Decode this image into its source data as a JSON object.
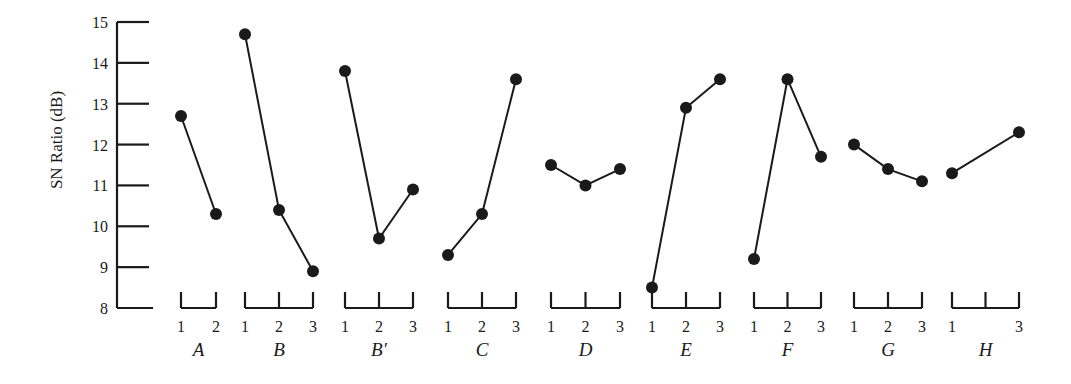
{
  "chart_data": {
    "type": "line",
    "title": "",
    "xlabel": "",
    "ylabel": "SN Ratio (dB)",
    "ylim": [
      8,
      15
    ],
    "yticks": [
      8,
      9,
      10,
      11,
      12,
      13,
      14,
      15
    ],
    "grid": false,
    "legend": null,
    "factors": [
      {
        "name": "A",
        "levels": [
          "1",
          "2"
        ],
        "level_labels": [
          "1",
          "2"
        ],
        "values": [
          12.7,
          10.3
        ]
      },
      {
        "name": "B",
        "levels": [
          "1",
          "2",
          "3"
        ],
        "level_labels": [
          "1",
          "2",
          "3"
        ],
        "values": [
          14.7,
          10.4,
          8.9
        ]
      },
      {
        "name": "B′",
        "levels": [
          "1",
          "2",
          "3"
        ],
        "level_labels": [
          "1",
          "2",
          "3"
        ],
        "values": [
          13.8,
          9.7,
          10.9
        ]
      },
      {
        "name": "C",
        "levels": [
          "1",
          "2",
          "3"
        ],
        "level_labels": [
          "1",
          "2",
          "3"
        ],
        "values": [
          9.3,
          10.3,
          13.6
        ]
      },
      {
        "name": "D",
        "levels": [
          "1",
          "2",
          "3"
        ],
        "level_labels": [
          "1",
          "2",
          "3"
        ],
        "values": [
          11.5,
          11.0,
          11.4
        ]
      },
      {
        "name": "E",
        "levels": [
          "1",
          "2",
          "3"
        ],
        "level_labels": [
          "1",
          "2",
          "3"
        ],
        "values": [
          8.5,
          12.9,
          13.6
        ]
      },
      {
        "name": "F",
        "levels": [
          "1",
          "2",
          "3"
        ],
        "level_labels": [
          "1",
          "2",
          "3"
        ],
        "values": [
          9.2,
          13.6,
          11.7
        ]
      },
      {
        "name": "G",
        "levels": [
          "1",
          "2",
          "3"
        ],
        "level_labels": [
          "1",
          "2",
          "3"
        ],
        "values": [
          12.0,
          11.4,
          11.1
        ]
      },
      {
        "name": "H",
        "levels": [
          "1",
          "3"
        ],
        "level_labels": [
          "1",
          "",
          "3"
        ],
        "values": [
          11.3,
          12.3
        ]
      }
    ]
  }
}
